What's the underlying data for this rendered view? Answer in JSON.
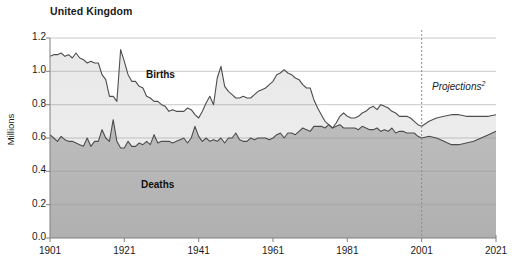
{
  "chart_data": {
    "type": "area",
    "title": "United Kingdom",
    "xlabel": "",
    "ylabel": "Millions",
    "xlim": [
      1901,
      2021
    ],
    "ylim": [
      0.0,
      1.2
    ],
    "grid": true,
    "legend_position": "inline-annotation",
    "x_tick_labels": [
      "1901",
      "1921",
      "1941",
      "1961",
      "1981",
      "2001",
      "2021"
    ],
    "x_ticks": [
      1901,
      1921,
      1941,
      1961,
      1981,
      2001,
      2021
    ],
    "y_tick_labels": [
      "0.0",
      "0.2",
      "0.4",
      "0.6",
      "0.8",
      "1.0",
      "1.2"
    ],
    "y_ticks": [
      0.0,
      0.2,
      0.4,
      0.6,
      0.8,
      1.0,
      1.2
    ],
    "annotations": [
      {
        "text": "Projections",
        "superscript": "2",
        "x": 2001,
        "style": "italic"
      },
      {
        "text": "Births",
        "x": 1936,
        "y": 0.9
      },
      {
        "text": "Deaths",
        "x": 1935,
        "y": 0.3
      }
    ],
    "projection_divider_x": 2001,
    "colors": {
      "births_fill": "#e6e6e6",
      "deaths_fill": "#b4b4b4",
      "below_deaths_fill": "#d8d8d8",
      "line": "#4d4d4d",
      "grid": "#999999",
      "axis": "#808080",
      "text": "#1a1a1a"
    },
    "series": [
      {
        "name": "Births",
        "x": [
          1901,
          1902,
          1903,
          1904,
          1905,
          1906,
          1907,
          1908,
          1909,
          1910,
          1911,
          1912,
          1913,
          1914,
          1915,
          1916,
          1917,
          1918,
          1919,
          1920,
          1921,
          1922,
          1923,
          1924,
          1925,
          1926,
          1927,
          1928,
          1929,
          1930,
          1931,
          1932,
          1933,
          1934,
          1935,
          1936,
          1937,
          1938,
          1939,
          1940,
          1941,
          1942,
          1943,
          1944,
          1945,
          1946,
          1947,
          1948,
          1949,
          1950,
          1951,
          1952,
          1953,
          1954,
          1955,
          1956,
          1957,
          1958,
          1959,
          1960,
          1961,
          1962,
          1963,
          1964,
          1965,
          1966,
          1967,
          1968,
          1969,
          1970,
          1971,
          1972,
          1973,
          1974,
          1975,
          1976,
          1977,
          1978,
          1979,
          1980,
          1981,
          1982,
          1983,
          1984,
          1985,
          1986,
          1987,
          1988,
          1989,
          1990,
          1991,
          1992,
          1993,
          1994,
          1995,
          1996,
          1997,
          1998,
          1999,
          2000,
          2001,
          2003,
          2005,
          2007,
          2009,
          2011,
          2013,
          2015,
          2017,
          2019,
          2021
        ],
        "values": [
          1.09,
          1.1,
          1.1,
          1.11,
          1.09,
          1.1,
          1.08,
          1.11,
          1.08,
          1.07,
          1.05,
          1.06,
          1.05,
          1.05,
          0.98,
          0.95,
          0.85,
          0.85,
          0.82,
          1.13,
          1.06,
          0.98,
          0.94,
          0.94,
          0.91,
          0.9,
          0.85,
          0.84,
          0.82,
          0.82,
          0.8,
          0.79,
          0.76,
          0.77,
          0.76,
          0.76,
          0.76,
          0.78,
          0.77,
          0.74,
          0.72,
          0.76,
          0.81,
          0.85,
          0.8,
          0.96,
          1.03,
          0.91,
          0.88,
          0.86,
          0.84,
          0.84,
          0.85,
          0.84,
          0.84,
          0.86,
          0.88,
          0.89,
          0.9,
          0.92,
          0.94,
          0.98,
          0.99,
          1.01,
          0.99,
          0.98,
          0.96,
          0.95,
          0.92,
          0.9,
          0.9,
          0.83,
          0.78,
          0.74,
          0.7,
          0.68,
          0.66,
          0.69,
          0.73,
          0.75,
          0.73,
          0.72,
          0.72,
          0.73,
          0.75,
          0.76,
          0.78,
          0.79,
          0.77,
          0.8,
          0.79,
          0.78,
          0.76,
          0.75,
          0.73,
          0.73,
          0.73,
          0.72,
          0.7,
          0.68,
          0.67,
          0.7,
          0.72,
          0.73,
          0.74,
          0.74,
          0.73,
          0.73,
          0.73,
          0.73,
          0.74
        ]
      },
      {
        "name": "Deaths",
        "x": [
          1901,
          1902,
          1903,
          1904,
          1905,
          1906,
          1907,
          1908,
          1909,
          1910,
          1911,
          1912,
          1913,
          1914,
          1915,
          1916,
          1917,
          1918,
          1919,
          1920,
          1921,
          1922,
          1923,
          1924,
          1925,
          1926,
          1927,
          1928,
          1929,
          1930,
          1931,
          1932,
          1933,
          1934,
          1935,
          1936,
          1937,
          1938,
          1939,
          1940,
          1941,
          1942,
          1943,
          1944,
          1945,
          1946,
          1947,
          1948,
          1949,
          1950,
          1951,
          1952,
          1953,
          1954,
          1955,
          1956,
          1957,
          1958,
          1959,
          1960,
          1961,
          1962,
          1963,
          1964,
          1965,
          1966,
          1967,
          1968,
          1969,
          1970,
          1971,
          1972,
          1973,
          1974,
          1975,
          1976,
          1977,
          1978,
          1979,
          1980,
          1981,
          1982,
          1983,
          1984,
          1985,
          1986,
          1987,
          1988,
          1989,
          1990,
          1991,
          1992,
          1993,
          1994,
          1995,
          1996,
          1997,
          1998,
          1999,
          2000,
          2001,
          2003,
          2005,
          2007,
          2009,
          2011,
          2013,
          2015,
          2017,
          2019,
          2021
        ],
        "values": [
          0.62,
          0.6,
          0.58,
          0.61,
          0.59,
          0.58,
          0.58,
          0.57,
          0.56,
          0.55,
          0.6,
          0.55,
          0.58,
          0.58,
          0.65,
          0.6,
          0.58,
          0.71,
          0.58,
          0.54,
          0.54,
          0.58,
          0.55,
          0.55,
          0.57,
          0.56,
          0.58,
          0.56,
          0.62,
          0.57,
          0.58,
          0.58,
          0.58,
          0.57,
          0.58,
          0.59,
          0.6,
          0.57,
          0.6,
          0.67,
          0.61,
          0.58,
          0.6,
          0.58,
          0.59,
          0.58,
          0.6,
          0.57,
          0.6,
          0.6,
          0.63,
          0.59,
          0.58,
          0.58,
          0.6,
          0.59,
          0.6,
          0.6,
          0.6,
          0.59,
          0.6,
          0.62,
          0.63,
          0.6,
          0.63,
          0.63,
          0.62,
          0.64,
          0.66,
          0.65,
          0.64,
          0.67,
          0.67,
          0.67,
          0.66,
          0.68,
          0.66,
          0.67,
          0.68,
          0.66,
          0.66,
          0.66,
          0.66,
          0.65,
          0.67,
          0.66,
          0.65,
          0.65,
          0.66,
          0.64,
          0.65,
          0.64,
          0.66,
          0.63,
          0.64,
          0.64,
          0.63,
          0.63,
          0.63,
          0.61,
          0.6,
          0.61,
          0.6,
          0.58,
          0.56,
          0.56,
          0.57,
          0.58,
          0.6,
          0.62,
          0.64
        ]
      }
    ]
  }
}
